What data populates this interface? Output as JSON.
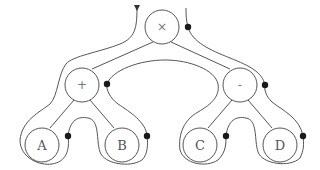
{
  "diagram": {
    "type": "expression-tree-euler-tour",
    "colors": {
      "stroke": "#555555",
      "dot": "#1a1a1a",
      "background": "#ffffff"
    },
    "nodes": [
      {
        "id": "times",
        "label": "×",
        "x": 162,
        "y": 27,
        "r": 17
      },
      {
        "id": "plus",
        "label": "+",
        "x": 82,
        "y": 85,
        "r": 17
      },
      {
        "id": "minus",
        "label": "-",
        "x": 240,
        "y": 85,
        "r": 17
      },
      {
        "id": "A",
        "label": "A",
        "x": 42,
        "y": 145,
        "r": 17
      },
      {
        "id": "B",
        "label": "B",
        "x": 122,
        "y": 145,
        "r": 17
      },
      {
        "id": "C",
        "label": "C",
        "x": 200,
        "y": 145,
        "r": 17
      },
      {
        "id": "D",
        "label": "D",
        "x": 280,
        "y": 145,
        "r": 17
      }
    ],
    "edges": [
      [
        "times",
        "plus"
      ],
      [
        "times",
        "minus"
      ],
      [
        "plus",
        "A"
      ],
      [
        "plus",
        "B"
      ],
      [
        "minus",
        "C"
      ],
      [
        "minus",
        "D"
      ]
    ],
    "visit_dots": [
      {
        "near": "times",
        "x": 188,
        "y": 27
      },
      {
        "near": "plus",
        "x": 107,
        "y": 84
      },
      {
        "near": "minus",
        "x": 265,
        "y": 85
      },
      {
        "near": "A",
        "x": 68,
        "y": 136
      },
      {
        "near": "B",
        "x": 147,
        "y": 136
      },
      {
        "near": "C",
        "x": 226,
        "y": 136
      },
      {
        "near": "D",
        "x": 303,
        "y": 136
      }
    ]
  }
}
